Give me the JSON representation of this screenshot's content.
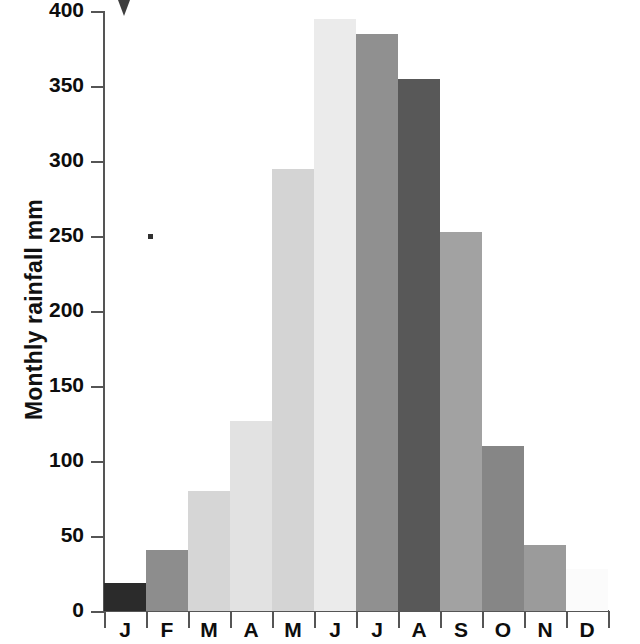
{
  "chart_data": {
    "type": "bar",
    "title": "",
    "xlabel": "",
    "ylabel": "Monthly rainfall mm",
    "ylim": [
      0,
      400
    ],
    "yticks": [
      0,
      50,
      100,
      150,
      200,
      250,
      300,
      350,
      400
    ],
    "grid": false,
    "legend": "none",
    "categories": [
      "J",
      "F",
      "M",
      "A",
      "M",
      "J",
      "J",
      "A",
      "S",
      "O",
      "N",
      "D"
    ],
    "category_names": [
      "January",
      "February",
      "March",
      "April",
      "May",
      "June",
      "July",
      "August",
      "September",
      "October",
      "November",
      "December"
    ],
    "values": [
      19,
      41,
      80,
      127,
      295,
      395,
      385,
      355,
      253,
      110,
      44,
      28
    ],
    "bar_colors": [
      "#2b2b2b",
      "#8d8d8d",
      "#d6d6d6",
      "#e2e2e2",
      "#d4d4d4",
      "#ebebeb",
      "#909090",
      "#585858",
      "#a2a2a2",
      "#868686",
      "#9b9b9b",
      "#fbfbfb"
    ],
    "axis_color": "#555555",
    "text_color": "#0d0d0d",
    "background": "#ffffff"
  },
  "annotations": {
    "arrow_marker": "scan-artifact-arrow",
    "dot_marker": "scan-artifact-dot"
  }
}
